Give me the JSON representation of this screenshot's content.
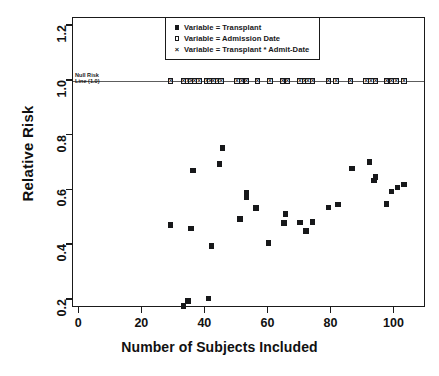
{
  "chart_data": {
    "type": "scatter",
    "title": "",
    "xlabel": "Number of Subjects Included",
    "ylabel": "Relative Risk",
    "xlim": [
      -2,
      110
    ],
    "ylim": [
      0.17,
      1.23
    ],
    "xticks": [
      0,
      20,
      40,
      60,
      80,
      100
    ],
    "yticks": [
      0.2,
      0.4,
      0.6,
      0.8,
      1.0,
      1.2
    ],
    "grid": false,
    "legend_position": "top-center",
    "reference_line": {
      "value": 1.0,
      "label_line1": "Null Risk",
      "label_line2": "Line (1.0)",
      "color": "#5d5d5d"
    },
    "series": [
      {
        "name": "Variable = Transplant",
        "marker": "filled-square",
        "color": "#17181a",
        "points": [
          [
            29,
            0.473
          ],
          [
            33,
            0.178
          ],
          [
            34.5,
            0.196
          ],
          [
            35.5,
            0.461
          ],
          [
            36,
            0.672
          ],
          [
            41,
            0.205
          ],
          [
            42,
            0.396
          ],
          [
            44.5,
            0.697
          ],
          [
            45.5,
            0.755
          ],
          [
            51,
            0.496
          ],
          [
            53,
            0.575
          ],
          [
            53,
            0.592
          ],
          [
            56,
            0.536
          ],
          [
            60,
            0.407
          ],
          [
            65,
            0.481
          ],
          [
            65.5,
            0.514
          ],
          [
            70,
            0.483
          ],
          [
            72,
            0.452
          ],
          [
            74,
            0.484
          ],
          [
            79,
            0.537
          ],
          [
            82,
            0.549
          ],
          [
            86.5,
            0.679
          ],
          [
            92,
            0.704
          ],
          [
            93.5,
            0.636
          ],
          [
            94,
            0.648
          ],
          [
            97.5,
            0.551
          ],
          [
            99,
            0.596
          ],
          [
            101,
            0.611
          ],
          [
            103,
            0.622
          ]
        ]
      },
      {
        "name": "Variable = Admission Date",
        "marker": "open-square",
        "color": "#17181a",
        "points": [
          [
            29,
            1.0
          ],
          [
            33,
            1.0
          ],
          [
            34.5,
            1.0
          ],
          [
            35.5,
            1.0
          ],
          [
            36.5,
            1.0
          ],
          [
            38,
            1.0
          ],
          [
            40.5,
            1.0
          ],
          [
            41.5,
            1.0
          ],
          [
            42.5,
            1.0
          ],
          [
            44,
            1.0
          ],
          [
            45,
            1.0
          ],
          [
            50,
            1.0
          ],
          [
            51.5,
            1.0
          ],
          [
            53,
            1.0
          ],
          [
            56.5,
            1.0
          ],
          [
            60.5,
            1.0
          ],
          [
            64.5,
            1.0
          ],
          [
            66,
            1.0
          ],
          [
            70,
            1.0
          ],
          [
            71.5,
            1.0
          ],
          [
            72.5,
            1.0
          ],
          [
            74,
            1.0
          ],
          [
            79,
            1.0
          ],
          [
            81.5,
            1.0
          ],
          [
            86,
            1.0
          ],
          [
            91,
            1.0
          ],
          [
            92.5,
            1.0
          ],
          [
            94,
            1.0
          ],
          [
            97.5,
            1.0
          ],
          [
            99,
            1.0
          ],
          [
            100.5,
            1.0
          ],
          [
            103,
            1.0
          ]
        ]
      },
      {
        "name": "Variable = Transplant * Admit-Date",
        "marker": "cross",
        "color": "#17181a",
        "points": [
          [
            29,
            1.0
          ],
          [
            33,
            1.0
          ],
          [
            34.5,
            1.0
          ],
          [
            35.5,
            1.0
          ],
          [
            36.5,
            1.0
          ],
          [
            38,
            1.0
          ],
          [
            40.5,
            1.0
          ],
          [
            41.5,
            1.0
          ],
          [
            42.5,
            1.0
          ],
          [
            44,
            1.0
          ],
          [
            45,
            1.0
          ],
          [
            50,
            1.0
          ],
          [
            51.5,
            1.0
          ],
          [
            53,
            1.0
          ],
          [
            56.5,
            1.0
          ],
          [
            60.5,
            1.0
          ],
          [
            64.5,
            1.0
          ],
          [
            66,
            1.0
          ],
          [
            70,
            1.0
          ],
          [
            71.5,
            1.0
          ],
          [
            72.5,
            1.0
          ],
          [
            74,
            1.0
          ],
          [
            79,
            1.0
          ],
          [
            81.5,
            1.0
          ],
          [
            86,
            1.0
          ],
          [
            91,
            1.0
          ],
          [
            92.5,
            1.0
          ],
          [
            94,
            1.0
          ],
          [
            97.5,
            1.0
          ],
          [
            99,
            1.0
          ],
          [
            100.5,
            1.0
          ],
          [
            103,
            1.0
          ]
        ]
      }
    ]
  },
  "legend": {
    "entries": [
      {
        "symbol": "filled-square",
        "label": "Variable = Transplant"
      },
      {
        "symbol": "open-square",
        "label": "Variable = Admission Date"
      },
      {
        "symbol": "cross",
        "label": "Variable = Transplant * Admit-Date"
      }
    ]
  }
}
